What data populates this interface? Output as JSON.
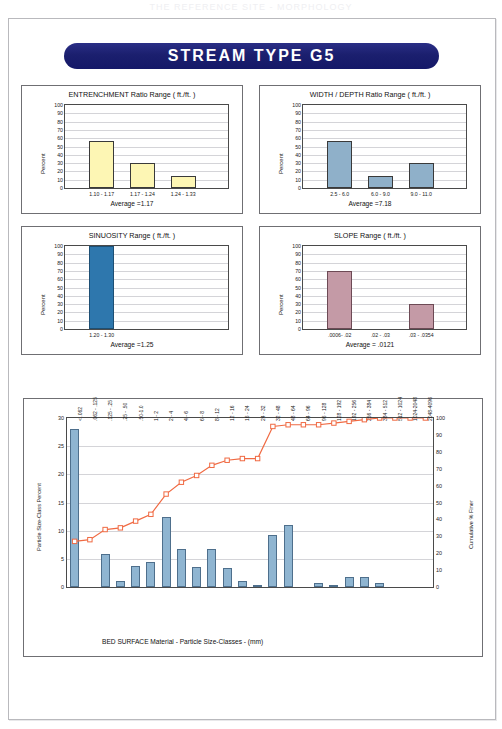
{
  "page": {
    "top_faint_text": "THE REFERENCE SITE - MORPHOLOGY"
  },
  "banner": {
    "title": "STREAM  TYPE  G5"
  },
  "panels": [
    {
      "key": "entrenchment",
      "title": "ENTRENCHMENT  Ratio Range ( ft./ft. )",
      "ylabel": "Percent",
      "average_label": "Average =1.17",
      "bar_color": "#fdf6b4",
      "bar_border": "#3a3a3a"
    },
    {
      "key": "width_depth",
      "title": "WIDTH / DEPTH  Ratio Range ( ft./ft. )",
      "ylabel": "Percent",
      "average_label": "Average =7.18",
      "bar_color": "#8fb0c9",
      "bar_border": "#3a3a3a"
    },
    {
      "key": "sinuosity",
      "title": "SINUOSITY  Range ( ft./ft. )",
      "ylabel": "Percent",
      "average_label": "Average =1.25",
      "bar_color": "#2e77ad",
      "bar_border": "#1d4f74"
    },
    {
      "key": "slope",
      "title": "SLOPE  Range ( ft./ft. )",
      "ylabel": "Percent",
      "average_label": "Average = .0121",
      "bar_color": "#c49aa6",
      "bar_border": "#6d4a55"
    }
  ],
  "chart_data": [
    {
      "type": "bar",
      "key": "entrenchment",
      "title": "ENTRENCHMENT  Ratio Range ( ft./ft. )",
      "xlabel": "Average =1.17",
      "ylabel": "Percent",
      "categories": [
        "1.10 - 1.17",
        "1.17 - 1.24",
        "1.24 - 1.33"
      ],
      "values": [
        57,
        30,
        15
      ],
      "ylim": [
        0,
        100
      ],
      "yticks": [
        0,
        10,
        20,
        30,
        40,
        50,
        60,
        70,
        80,
        90,
        100
      ],
      "grid": true,
      "average": 1.17
    },
    {
      "type": "bar",
      "key": "width_depth",
      "title": "WIDTH / DEPTH  Ratio Range ( ft./ft. )",
      "xlabel": "Average =7.18",
      "ylabel": "Percent",
      "categories": [
        "2.5 - 6.0",
        "6.0 - 9.0",
        "9.0 - 11.0"
      ],
      "values": [
        57,
        15,
        30
      ],
      "ylim": [
        0,
        100
      ],
      "yticks": [
        0,
        10,
        20,
        30,
        40,
        50,
        60,
        70,
        80,
        90,
        100
      ],
      "grid": true,
      "average": 7.18
    },
    {
      "type": "bar",
      "key": "sinuosity",
      "title": "SINUOSITY  Range ( ft./ft. )",
      "xlabel": "Average =1.25",
      "ylabel": "Percent",
      "categories": [
        "1.20 - 1.30"
      ],
      "values": [
        100
      ],
      "ylim": [
        0,
        100
      ],
      "yticks": [
        0,
        10,
        20,
        30,
        40,
        50,
        60,
        70,
        80,
        90,
        100
      ],
      "grid": true,
      "average": 1.25
    },
    {
      "type": "bar",
      "key": "slope",
      "title": "SLOPE  Range ( ft./ft. )",
      "xlabel": "Average = .0121",
      "ylabel": "Percent",
      "categories": [
        ".0006- .02",
        ".02 - .03",
        ".03 - .0354"
      ],
      "values": [
        70,
        0,
        30
      ],
      "ylim": [
        0,
        100
      ],
      "yticks": [
        0,
        10,
        20,
        30,
        40,
        50,
        60,
        70,
        80,
        90,
        100
      ],
      "grid": true,
      "average": 0.0121
    },
    {
      "type": "bar",
      "key": "bed_surface",
      "title": "BED SURFACE  Material  -  Particle Size-Classes  - (mm)",
      "xlabel": "BED SURFACE  Material  -  Particle Size-Classes  - (mm)",
      "ylabel": "Particle Size-Class Percent",
      "ylabel_right": "Cumulative % Finer",
      "ylim": [
        0,
        30
      ],
      "yticks": [
        0,
        5,
        10,
        15,
        20,
        25,
        30
      ],
      "ylim_right": [
        0,
        100
      ],
      "yticks_right": [
        0,
        10,
        20,
        30,
        40,
        50,
        60,
        70,
        80,
        90,
        100
      ],
      "grid": true,
      "categories": [
        "< .062",
        ".062 - .125",
        ".125 - .25",
        ".25 - .50",
        ".50-1.0",
        "1 - 2",
        "2 - 4",
        "4 - 6",
        "6 - 8",
        "8 - 12",
        "12 - 16",
        "16 - 24",
        "24 - 32",
        "32 - 48",
        "48 - 64",
        "64 - 96",
        "96 - 128",
        "128 - 192",
        "192 - 256",
        "256 - 384",
        "384 - 512",
        "512 - 1024",
        "1024-2048",
        "2048-4096"
      ],
      "series": [
        {
          "name": "Particle Size-Class Percent",
          "type": "bar",
          "axis": "left",
          "color": "#8fb5d1",
          "values": [
            28.0,
            0,
            5.8,
            1.0,
            3.7,
            4.5,
            12.5,
            6.8,
            3.6,
            6.8,
            3.3,
            1.0,
            0.3,
            9.2,
            11.0,
            0,
            0.7,
            0.4,
            1.8,
            1.8,
            0.8,
            0,
            0,
            0
          ]
        },
        {
          "name": "Cumulative % Finer",
          "type": "line",
          "axis": "right",
          "color": "#f06a43",
          "values": [
            27,
            28,
            34,
            35,
            39,
            43,
            55,
            62,
            66,
            72,
            75,
            76,
            76,
            95,
            96,
            96,
            96,
            97,
            98,
            99,
            100,
            100,
            100,
            100
          ]
        }
      ]
    }
  ]
}
